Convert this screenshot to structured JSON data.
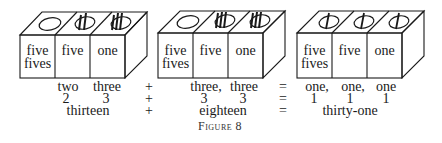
{
  "figure": {
    "caption": "Figure 8",
    "boxes": [
      {
        "name": "two-three",
        "faces": [
          {
            "label_line1": "five",
            "label_line2": "fives",
            "top_glyph": "zero-ellipse"
          },
          {
            "label_line1": "five",
            "label_line2": "",
            "top_glyph": "two-strokes-ellipse"
          },
          {
            "label_line1": "one",
            "label_line2": "",
            "top_glyph": "three-strokes-ellipse"
          }
        ]
      },
      {
        "name": "three-three",
        "faces": [
          {
            "label_line1": "five",
            "label_line2": "fives",
            "top_glyph": "zero-ellipse"
          },
          {
            "label_line1": "five",
            "label_line2": "",
            "top_glyph": "three-strokes-ellipse"
          },
          {
            "label_line1": "one",
            "label_line2": "",
            "top_glyph": "three-strokes-ellipse"
          }
        ]
      },
      {
        "name": "one-one-one",
        "faces": [
          {
            "label_line1": "five",
            "label_line2": "fives",
            "top_glyph": "one-stroke-ellipse"
          },
          {
            "label_line1": "five",
            "label_line2": "",
            "top_glyph": "one-stroke-ellipse"
          },
          {
            "label_line1": "one",
            "label_line2": "",
            "top_glyph": "one-stroke-ellipse"
          }
        ]
      }
    ],
    "equation": {
      "row_words": {
        "a1": "two",
        "a2": "three",
        "op1": "+",
        "b1": "three,",
        "b2": "three",
        "op2": "=",
        "c1": "one,",
        "c2": "one,",
        "c3": "one"
      },
      "row_digits": {
        "a1": "2",
        "a2": "3",
        "op1": "+",
        "b1": "3",
        "b2": "3",
        "op2": "=",
        "c1": "1",
        "c2": "1",
        "c3": "1"
      },
      "row_totals": {
        "a": "thirteen",
        "op1": "+",
        "b": "eighteen",
        "op2": "=",
        "c": "thirty-one"
      }
    }
  }
}
